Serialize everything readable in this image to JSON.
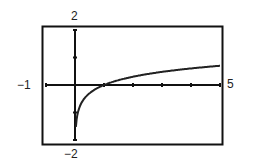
{
  "chart_data": {
    "type": "line",
    "title": "",
    "function": "y = log(x)",
    "xlabel": "",
    "ylabel": "",
    "xlim": [
      -1,
      5
    ],
    "ylim": [
      -2,
      2
    ],
    "xscale": 1,
    "yscale": 1,
    "grid": false,
    "legend": "none",
    "window_labels": {
      "xmin": "−1",
      "xmax": "5",
      "ymin": "−2",
      "ymax": "2"
    },
    "series": [
      {
        "name": "log x",
        "x": [
          0.03,
          0.05,
          0.1,
          0.2,
          0.3,
          0.5,
          0.75,
          1,
          1.5,
          2,
          2.5,
          3,
          3.5,
          4,
          4.5,
          5
        ],
        "y": [
          -1.52,
          -1.3,
          -1.0,
          -0.7,
          -0.52,
          -0.3,
          -0.12,
          0,
          0.18,
          0.3,
          0.4,
          0.48,
          0.54,
          0.6,
          0.65,
          0.7
        ]
      }
    ]
  }
}
